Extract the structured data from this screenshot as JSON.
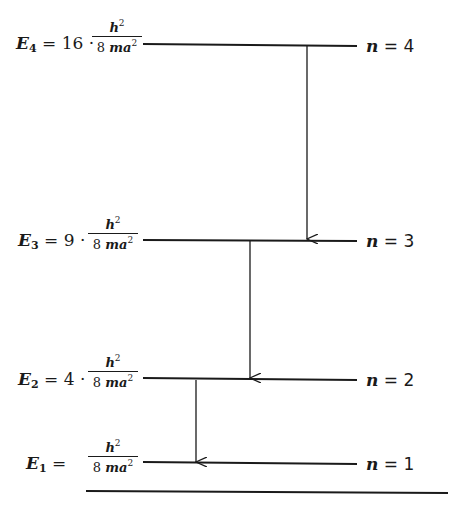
{
  "diagram": {
    "levels": [
      {
        "n_label": "n = 4",
        "n": "4",
        "energy_symbol": "E",
        "energy_sub": "4",
        "coefficient": "16 ·",
        "numerator": "h",
        "numerator_exp": "2",
        "denominator": "8 ma",
        "denominator_exp": "2"
      },
      {
        "n_label": "n = 3",
        "n": "3",
        "energy_symbol": "E",
        "energy_sub": "3",
        "coefficient": "9 ·",
        "numerator": "h",
        "numerator_exp": "2",
        "denominator": "8 ma",
        "denominator_exp": "2"
      },
      {
        "n_label": "n = 2",
        "n": "2",
        "energy_symbol": "E",
        "energy_sub": "2",
        "coefficient": "4 ·",
        "numerator": "h",
        "numerator_exp": "2",
        "denominator": "8 ma",
        "denominator_exp": "2"
      },
      {
        "n_label": "n = 1",
        "n": "1",
        "energy_symbol": "E",
        "energy_sub": "1",
        "coefficient": "",
        "numerator": "h",
        "numerator_exp": "2",
        "denominator": "8 ma",
        "denominator_exp": "2"
      }
    ],
    "transitions": [
      {
        "from": "4",
        "to": "3"
      },
      {
        "from": "3",
        "to": "2"
      },
      {
        "from": "2",
        "to": "1"
      }
    ],
    "equals": "=",
    "n_var": "n",
    "line_color": "#1a1a1a"
  }
}
